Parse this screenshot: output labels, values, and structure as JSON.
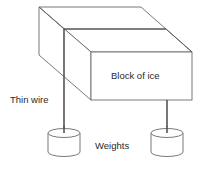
{
  "diagram": {
    "labels": {
      "block": "Block of ice",
      "wire": "Thin wire",
      "weights": "Weights"
    },
    "colors": {
      "line": "#6a6a6a",
      "wire": "#555555",
      "text": "#2a2a2a",
      "background": "#ffffff"
    }
  }
}
